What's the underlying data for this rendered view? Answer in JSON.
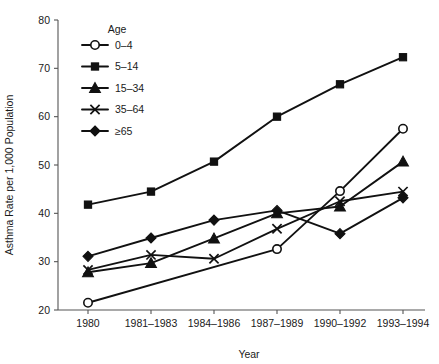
{
  "chart_data": {
    "type": "line",
    "title": "",
    "xlabel": "Year",
    "ylabel": "Asthma Rate per 1,000 Population",
    "categories": [
      "1980",
      "1981–1983",
      "1984–1986",
      "1987–1989",
      "1990–1992",
      "1993–1994"
    ],
    "ylim": [
      20,
      80
    ],
    "yticks": [
      20,
      30,
      40,
      50,
      60,
      70,
      80
    ],
    "ytick_labels": [
      "20",
      "30",
      "40",
      "50",
      "60",
      "70",
      "80"
    ],
    "grid": false,
    "legend_position": "upper-left-inside",
    "legend_title": "Age",
    "series": [
      {
        "name": "0–4",
        "marker": "open-circle",
        "values": [
          21.5,
          null,
          null,
          32.6,
          44.6,
          57.5
        ]
      },
      {
        "name": "5–14",
        "marker": "filled-square",
        "values": [
          41.8,
          44.5,
          50.7,
          60.0,
          66.7,
          72.3
        ]
      },
      {
        "name": "15–34",
        "marker": "filled-triangle",
        "values": [
          27.8,
          29.7,
          34.8,
          40.0,
          41.4,
          50.7
        ]
      },
      {
        "name": "35–64",
        "marker": "cross-x",
        "values": [
          28.3,
          31.4,
          30.6,
          36.8,
          42.5,
          44.5
        ]
      },
      {
        "name": "≥65",
        "marker": "filled-diamond",
        "values": [
          31.1,
          34.9,
          38.6,
          40.6,
          35.8,
          43.2
        ]
      }
    ]
  },
  "axes": {
    "x_title": "Year",
    "y_title": "Asthma Rate per 1,000 Population"
  },
  "legend": {
    "title": "Age",
    "items": [
      {
        "label": "0–4"
      },
      {
        "label": "5–14"
      },
      {
        "label": "15–34"
      },
      {
        "label": "35–64"
      },
      {
        "label": "≥65"
      }
    ]
  }
}
